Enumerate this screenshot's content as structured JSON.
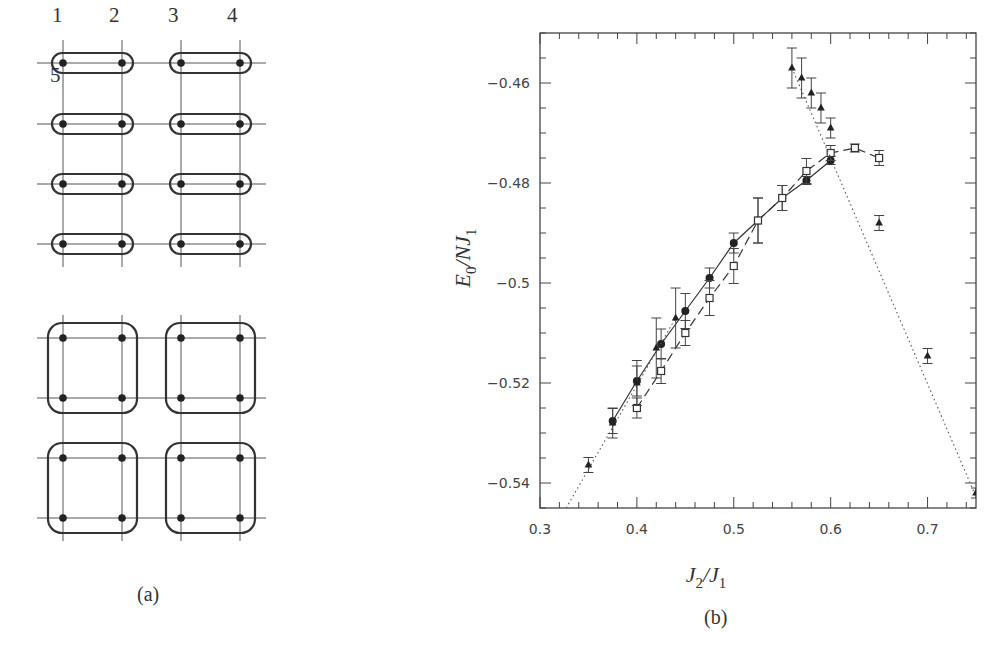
{
  "figure": {
    "panel_a": {
      "caption": "(a)",
      "site_labels": [
        {
          "text": "1",
          "x": 52,
          "y": 31
        },
        {
          "text": "2",
          "x": 109,
          "y": 31
        },
        {
          "text": "3",
          "x": 168,
          "y": 31
        },
        {
          "text": "4",
          "x": 227,
          "y": 31
        },
        {
          "text": "5",
          "x": 50,
          "y": 91
        }
      ],
      "lattice_top": {
        "columns_x": [
          63,
          122,
          181,
          240
        ],
        "rows_y": [
          63,
          124,
          184,
          244
        ],
        "clusters": "dimers"
      },
      "lattice_bottom": {
        "columns_x": [
          63,
          122,
          181,
          240
        ],
        "rows_y": [
          338,
          398,
          458,
          518
        ],
        "clusters": "plaquettes"
      }
    },
    "panel_b": {
      "caption": "(b)"
    }
  },
  "chart_data": {
    "type": "scatter",
    "title": "",
    "xlabel": "J_2/J_1",
    "ylabel": "E_0/NJ_1",
    "xlim": [
      0.3,
      0.75
    ],
    "ylim": [
      -0.545,
      -0.45
    ],
    "x_ticks": [
      0.3,
      0.4,
      0.5,
      0.6,
      0.7
    ],
    "x_tick_labels": [
      "0.3",
      "0.4",
      "0.5",
      "0.6",
      "0.7"
    ],
    "y_ticks": [
      -0.46,
      -0.48,
      -0.5,
      -0.52,
      -0.54
    ],
    "y_tick_labels": [
      "-0.46",
      "-0.48",
      "-0.5",
      "-0.52",
      "-0.54"
    ],
    "grid": false,
    "legend": "none",
    "series": [
      {
        "name": "filled circles (solid line)",
        "marker": "circle-filled",
        "line": "solid",
        "points": [
          {
            "x": 0.375,
            "y": -0.5276,
            "err": 0.0025
          },
          {
            "x": 0.4,
            "y": -0.5196,
            "err": 0.003
          },
          {
            "x": 0.425,
            "y": -0.5122,
            "err": 0.003
          },
          {
            "x": 0.45,
            "y": -0.5056,
            "err": 0.0035
          },
          {
            "x": 0.475,
            "y": -0.499,
            "err": 0.002
          },
          {
            "x": 0.5,
            "y": -0.492,
            "err": 0.002
          },
          {
            "x": 0.525,
            "y": -0.4875,
            "err": 0.0045
          },
          {
            "x": 0.55,
            "y": -0.483,
            "err": 0.0025
          },
          {
            "x": 0.575,
            "y": -0.4795,
            "err": 0.0008
          },
          {
            "x": 0.6,
            "y": -0.4755,
            "err": 0.0008
          }
        ]
      },
      {
        "name": "open squares (dashed line)",
        "marker": "square-open",
        "line": "dashed",
        "points": [
          {
            "x": 0.4,
            "y": -0.525,
            "err": 0.002
          },
          {
            "x": 0.425,
            "y": -0.5176,
            "err": 0.0025
          },
          {
            "x": 0.45,
            "y": -0.51,
            "err": 0.0025
          },
          {
            "x": 0.475,
            "y": -0.503,
            "err": 0.0035
          },
          {
            "x": 0.5,
            "y": -0.4966,
            "err": 0.0035
          },
          {
            "x": 0.525,
            "y": -0.4875,
            "err": 0.0045
          },
          {
            "x": 0.55,
            "y": -0.483,
            "err": 0.0025
          },
          {
            "x": 0.575,
            "y": -0.4776,
            "err": 0.0025
          },
          {
            "x": 0.6,
            "y": -0.474,
            "err": 0.0015
          },
          {
            "x": 0.625,
            "y": -0.473,
            "err": 0.0008
          },
          {
            "x": 0.65,
            "y": -0.475,
            "err": 0.0015
          }
        ]
      },
      {
        "name": "filled triangles (dotted line)",
        "marker": "triangle-filled",
        "line": "dotted",
        "points": [
          {
            "x": 0.35,
            "y": -0.5364,
            "err": 0.0015
          },
          {
            "x": 0.375,
            "y": -0.528,
            "err": 0.003
          },
          {
            "x": 0.4,
            "y": -0.52,
            "err": 0.0045
          },
          {
            "x": 0.42,
            "y": -0.513,
            "err": 0.006
          },
          {
            "x": 0.44,
            "y": -0.507,
            "err": 0.006
          },
          {
            "x": 0.56,
            "y": -0.457,
            "err": 0.004
          },
          {
            "x": 0.57,
            "y": -0.459,
            "err": 0.004
          },
          {
            "x": 0.58,
            "y": -0.462,
            "err": 0.003
          },
          {
            "x": 0.59,
            "y": -0.465,
            "err": 0.003
          },
          {
            "x": 0.6,
            "y": -0.469,
            "err": 0.002
          },
          {
            "x": 0.65,
            "y": -0.488,
            "err": 0.0015
          },
          {
            "x": 0.7,
            "y": -0.5146,
            "err": 0.0015
          },
          {
            "x": 0.75,
            "y": -0.542,
            "err": 0.001
          }
        ],
        "fit_lines": [
          {
            "from": {
              "x": 0.327,
              "y": -0.545
            },
            "to": {
              "x": 0.44,
              "y": -0.507
            }
          },
          {
            "from": {
              "x": 0.56,
              "y": -0.457
            },
            "to": {
              "x": 0.755,
              "y": -0.545
            }
          }
        ]
      }
    ]
  }
}
